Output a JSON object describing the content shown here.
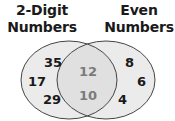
{
  "diagram": {
    "type": "venn",
    "sets": [
      {
        "label_line1": "2-Digit",
        "label_line2": "Numbers",
        "only_values": [
          "35",
          "17",
          "29"
        ]
      },
      {
        "label_line1": "Even",
        "label_line2": "Numbers",
        "only_values": [
          "8",
          "6",
          "4"
        ]
      }
    ],
    "intersection_values": [
      "12",
      "10"
    ],
    "colors": {
      "fill": "#ebebeb",
      "intersection_fill": "#e0e0e0",
      "stroke": "#444444",
      "text": "#1a1a1a",
      "intersection_text": "#7a7a7a"
    }
  }
}
